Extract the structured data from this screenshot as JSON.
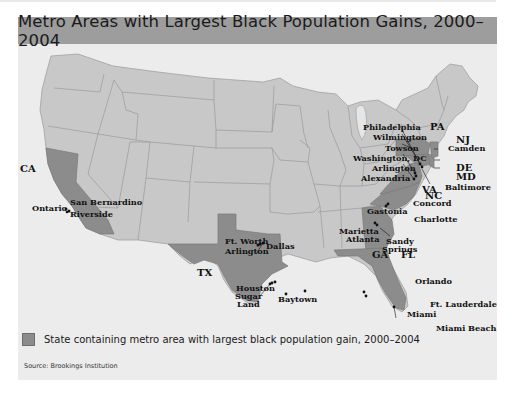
{
  "title": "Metro Areas with Largest Black Population Gains, 2000–2004",
  "colors": {
    "title_bar": "#9d9d9d",
    "panel_bg": "#ececec",
    "state_fill": "#c8c8c8",
    "highlight_fill": "#8c8c8c",
    "border": "#9a9a9a",
    "water": "#ececec"
  },
  "highlighted_states": [
    {
      "abbr": "CA",
      "metros": [
        "Ontario",
        "San Bernardino",
        "Riverside"
      ]
    },
    {
      "abbr": "TX",
      "metros": [
        "Ft. Worth",
        "Arlington",
        "Dallas",
        "Houston",
        "Sugar Land",
        "Baytown"
      ]
    },
    {
      "abbr": "GA",
      "metros": [
        "Marietta",
        "Atlanta",
        "Sandy Springs"
      ]
    },
    {
      "abbr": "FL",
      "metros": [
        "Orlando",
        "Ft. Lauderdale",
        "Miami",
        "Miami Beach"
      ]
    },
    {
      "abbr": "NC",
      "metros": [
        "Concord",
        "Gastonia",
        "Charlotte"
      ]
    },
    {
      "abbr": "PA",
      "metros": [
        "Philadelphia"
      ]
    },
    {
      "abbr": "NJ",
      "metros": [
        "Camden"
      ]
    },
    {
      "abbr": "DE",
      "metros": [
        "Wilmington"
      ]
    },
    {
      "abbr": "MD",
      "metros": [
        "Towson",
        "Baltimore"
      ]
    },
    {
      "abbr": "VA",
      "metros": [
        "Arlington",
        "Alexandria"
      ]
    }
  ],
  "state_labels": {
    "CA": "CA",
    "TX": "TX",
    "GA": "GA",
    "FL": "FL",
    "NC": "NC",
    "PA": "PA",
    "NJ": "NJ",
    "DE": "DE",
    "MD": "MD",
    "VA": "VA"
  },
  "city_labels": {
    "ontario": "Ontario",
    "san_bernardino": "San Bernardino",
    "riverside": "Riverside",
    "ft_worth": "Ft. Worth",
    "arlington_tx": "Arlington",
    "dallas": "Dallas",
    "houston": "Houston",
    "sugar": "Sugar",
    "land": "Land",
    "baytown": "Baytown",
    "marietta": "Marietta",
    "atlanta": "Atlanta",
    "sandy": "Sandy",
    "springs": "Springs",
    "orlando": "Orlando",
    "ft_lauderdale": "Ft. Lauderdale",
    "miami": "Miami",
    "miami_beach": "Miami Beach",
    "concord": "Concord",
    "gastonia": "Gastonia",
    "charlotte": "Charlotte",
    "philadelphia": "Philadelphia",
    "wilmington": "Wilmington",
    "towson": "Towson",
    "washington_dc": "Washington, DC",
    "arlington_va": "Arlington",
    "alexandria": "Alexandria",
    "camden": "Camden",
    "baltimore": "Baltimore"
  },
  "legend": {
    "label": "State containing metro area with largest black population gain, 2000–2004"
  },
  "source": "Source: Brookings Institution"
}
